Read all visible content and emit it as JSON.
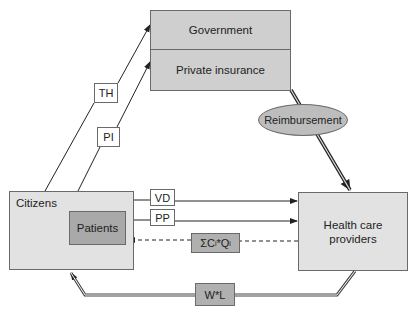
{
  "diagram": {
    "nodes": {
      "government": "Government",
      "private_insurance": "Private insurance",
      "citizens": "Citizens",
      "patients": "Patients",
      "health_care_providers_line1": "Health care",
      "health_care_providers_line2": "providers",
      "reimbursement": "Reimbursement"
    },
    "flows": {
      "th": "TH",
      "pi": "PI",
      "vd": "VD",
      "pp": "PP",
      "sum_prefix": "ΣC",
      "sum_sub1": "i",
      "sum_mid": "*Q",
      "sum_sub2": "i",
      "wl": "W*L"
    },
    "colors": {
      "box_dark": "#cfcfcf",
      "box_light": "#e2e2e2",
      "box_mid": "#a9a9a9",
      "line": "#222222"
    }
  }
}
